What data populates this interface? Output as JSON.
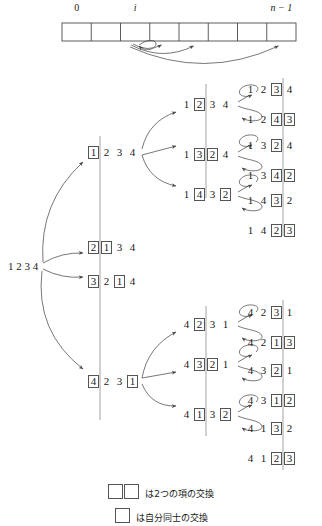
{
  "array_strip": {
    "cells": 8,
    "labels": [
      {
        "text": "0",
        "index": 0,
        "italic": false
      },
      {
        "text": "i",
        "index": 2,
        "italic": true
      },
      {
        "text": "n − 1",
        "index": 7,
        "italic": true
      }
    ]
  },
  "root": {
    "label": "1 2 3 4"
  },
  "level1": [
    {
      "cells": [
        {
          "v": "1",
          "box": true
        },
        {
          "v": "2",
          "box": false
        },
        {
          "v": "3",
          "box": false
        },
        {
          "v": "4",
          "box": false
        }
      ]
    },
    {
      "cells": [
        {
          "v": "2",
          "box": true
        },
        {
          "v": "1",
          "box": true
        },
        {
          "v": "3",
          "box": false
        },
        {
          "v": "4",
          "box": false
        }
      ]
    },
    {
      "cells": [
        {
          "v": "3",
          "box": true
        },
        {
          "v": "2",
          "box": false
        },
        {
          "v": "1",
          "box": true
        },
        {
          "v": "4",
          "box": false
        }
      ]
    },
    {
      "cells": [
        {
          "v": "4",
          "box": true
        },
        {
          "v": "2",
          "box": false
        },
        {
          "v": "3",
          "box": false
        },
        {
          "v": "1",
          "box": true
        }
      ]
    }
  ],
  "level2": [
    {
      "cells": [
        {
          "v": "1",
          "box": false
        },
        {
          "v": "2",
          "box": true
        },
        {
          "v": "3",
          "box": false
        },
        {
          "v": "4",
          "box": false
        }
      ]
    },
    {
      "cells": [
        {
          "v": "1",
          "box": false
        },
        {
          "v": "3",
          "box": true
        },
        {
          "v": "2",
          "box": true
        },
        {
          "v": "4",
          "box": false
        }
      ]
    },
    {
      "cells": [
        {
          "v": "1",
          "box": false
        },
        {
          "v": "4",
          "box": true
        },
        {
          "v": "3",
          "box": false
        },
        {
          "v": "2",
          "box": true
        }
      ]
    },
    {
      "cells": [
        {
          "v": "4",
          "box": false
        },
        {
          "v": "2",
          "box": true
        },
        {
          "v": "3",
          "box": false
        },
        {
          "v": "1",
          "box": false
        }
      ]
    },
    {
      "cells": [
        {
          "v": "4",
          "box": false
        },
        {
          "v": "3",
          "box": true
        },
        {
          "v": "2",
          "box": true
        },
        {
          "v": "1",
          "box": false
        }
      ]
    },
    {
      "cells": [
        {
          "v": "4",
          "box": false
        },
        {
          "v": "1",
          "box": true
        },
        {
          "v": "3",
          "box": false
        },
        {
          "v": "2",
          "box": true
        }
      ]
    }
  ],
  "level3": [
    {
      "cells": [
        {
          "v": "1",
          "box": false
        },
        {
          "v": "2",
          "box": false
        },
        {
          "v": "3",
          "box": true
        },
        {
          "v": "4",
          "box": false
        }
      ]
    },
    {
      "cells": [
        {
          "v": "1",
          "box": false
        },
        {
          "v": "2",
          "box": false
        },
        {
          "v": "4",
          "box": true
        },
        {
          "v": "3",
          "box": true
        }
      ]
    },
    {
      "cells": [
        {
          "v": "1",
          "box": false
        },
        {
          "v": "3",
          "box": false
        },
        {
          "v": "2",
          "box": true
        },
        {
          "v": "4",
          "box": false
        }
      ]
    },
    {
      "cells": [
        {
          "v": "1",
          "box": false
        },
        {
          "v": "3",
          "box": false
        },
        {
          "v": "4",
          "box": true
        },
        {
          "v": "2",
          "box": true
        }
      ]
    },
    {
      "cells": [
        {
          "v": "1",
          "box": false
        },
        {
          "v": "4",
          "box": false
        },
        {
          "v": "3",
          "box": true
        },
        {
          "v": "2",
          "box": false
        }
      ]
    },
    {
      "cells": [
        {
          "v": "1",
          "box": false
        },
        {
          "v": "4",
          "box": false
        },
        {
          "v": "2",
          "box": true
        },
        {
          "v": "3",
          "box": true
        }
      ]
    },
    {
      "cells": [
        {
          "v": "4",
          "box": false
        },
        {
          "v": "2",
          "box": false
        },
        {
          "v": "3",
          "box": true
        },
        {
          "v": "1",
          "box": false
        }
      ]
    },
    {
      "cells": [
        {
          "v": "4",
          "box": false
        },
        {
          "v": "2",
          "box": false
        },
        {
          "v": "1",
          "box": true
        },
        {
          "v": "3",
          "box": true
        }
      ]
    },
    {
      "cells": [
        {
          "v": "4",
          "box": false
        },
        {
          "v": "3",
          "box": false
        },
        {
          "v": "2",
          "box": true
        },
        {
          "v": "1",
          "box": false
        }
      ]
    },
    {
      "cells": [
        {
          "v": "4",
          "box": false
        },
        {
          "v": "3",
          "box": false
        },
        {
          "v": "1",
          "box": true
        },
        {
          "v": "2",
          "box": true
        }
      ]
    },
    {
      "cells": [
        {
          "v": "4",
          "box": false
        },
        {
          "v": "1",
          "box": false
        },
        {
          "v": "3",
          "box": true
        },
        {
          "v": "2",
          "box": false
        }
      ]
    },
    {
      "cells": [
        {
          "v": "4",
          "box": false
        },
        {
          "v": "1",
          "box": false
        },
        {
          "v": "2",
          "box": true
        },
        {
          "v": "3",
          "box": true
        }
      ]
    }
  ],
  "legend": [
    {
      "boxes": 2,
      "text": "は2つの項の交換"
    },
    {
      "boxes": 1,
      "text": "は自分同士の交換"
    }
  ],
  "colors": {
    "line": "#555555",
    "text": "#1a1a1a",
    "background": "#ffffff"
  }
}
